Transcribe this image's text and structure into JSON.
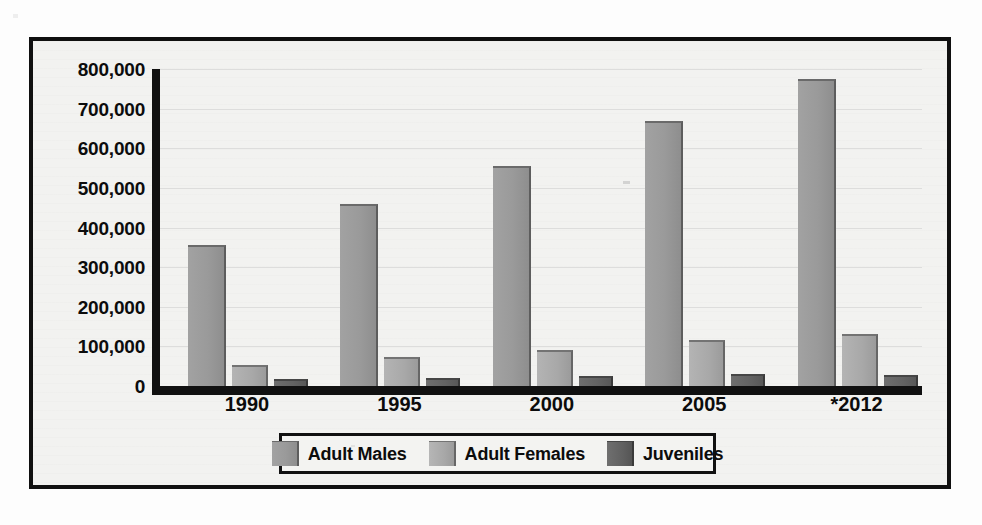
{
  "chart_data": {
    "type": "bar",
    "title": "",
    "xlabel": "",
    "ylabel": "",
    "categories": [
      "1990",
      "1995",
      "2000",
      "2005",
      "*2012"
    ],
    "series": [
      {
        "name": "Adult Males",
        "key": "males",
        "color": "#9a9a9a",
        "values": [
          350000,
          455000,
          550000,
          665000,
          770000
        ]
      },
      {
        "name": "Adult Females",
        "key": "females",
        "color": "#a8a8a8",
        "values": [
          49000,
          67000,
          87000,
          111000,
          126000
        ]
      },
      {
        "name": "Juveniles",
        "key": "juveniles",
        "color": "#616161",
        "values": [
          12000,
          16000,
          21000,
          25000,
          24000
        ]
      }
    ],
    "ylim": [
      0,
      800000
    ],
    "ytick_values": [
      800000,
      700000,
      600000,
      500000,
      400000,
      300000,
      200000,
      100000,
      0
    ],
    "ytick_labels": [
      "800,000",
      "700,000",
      "600,000",
      "500,000",
      "400,000",
      "300,000",
      "200,000",
      "100,000",
      "0"
    ],
    "grid": true,
    "legend_position": "bottom"
  },
  "legend": {
    "items": [
      {
        "label": "Adult Males",
        "swatch": "males"
      },
      {
        "label": "Adult Females",
        "swatch": "females"
      },
      {
        "label": "Juveniles",
        "swatch": "juveniles"
      }
    ]
  },
  "colors": {
    "frame": "#101010",
    "plate_background": "#f2f2f0",
    "axis": "#111111",
    "text": "#0c0c0c"
  }
}
